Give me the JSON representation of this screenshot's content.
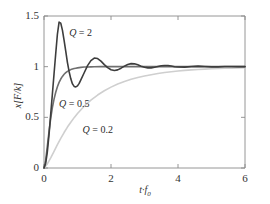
{
  "chart_data": {
    "type": "line",
    "title": "",
    "subtitle": "",
    "xlabel": "t·f0",
    "xlabel_parts": {
      "var": "t",
      "dot": "·",
      "f": "f",
      "sub": "0"
    },
    "ylabel": "x[F/k]",
    "ylabel_parts": {
      "x": "x",
      "open": "[",
      "F": "F",
      "slash": "/",
      "k": "k",
      "close": "]"
    },
    "xlim": [
      0,
      6
    ],
    "ylim": [
      0,
      1.5
    ],
    "xticks": [
      0,
      2,
      4,
      6
    ],
    "xtick_labels": [
      "0",
      "2",
      "4",
      "6"
    ],
    "yticks": [
      0,
      0.5,
      1,
      1.5
    ],
    "ytick_labels": [
      "0",
      "0.5",
      "1",
      "1.5"
    ],
    "grid": false,
    "legend_position": "inline-annotations",
    "axis_color": "#8a8a8a",
    "background": "#ffffff",
    "series": [
      {
        "name": "Q = 2",
        "label": "Q = 2",
        "q": 2,
        "color": "#3d3d3d",
        "width": 1.6,
        "annotation_x": 0.75,
        "annotation_y": 1.32,
        "description": "Underdamped step response, overshoot to 1.45 at t*f0=0.45, ringing decays by t*f0=4",
        "points": [
          [
            0.0,
            0.0
          ],
          [
            0.05,
            0.045
          ],
          [
            0.1,
            0.16
          ],
          [
            0.15,
            0.33
          ],
          [
            0.2,
            0.53
          ],
          [
            0.25,
            0.73
          ],
          [
            0.3,
            0.93
          ],
          [
            0.35,
            1.13
          ],
          [
            0.4,
            1.32
          ],
          [
            0.45,
            1.44
          ],
          [
            0.5,
            1.43
          ],
          [
            0.55,
            1.36
          ],
          [
            0.6,
            1.26
          ],
          [
            0.65,
            1.15
          ],
          [
            0.7,
            1.04
          ],
          [
            0.75,
            0.95
          ],
          [
            0.8,
            0.88
          ],
          [
            0.85,
            0.83
          ],
          [
            0.9,
            0.805
          ],
          [
            0.95,
            0.8
          ],
          [
            1.0,
            0.81
          ],
          [
            1.05,
            0.835
          ],
          [
            1.1,
            0.87
          ],
          [
            1.2,
            0.94
          ],
          [
            1.3,
            1.01
          ],
          [
            1.4,
            1.06
          ],
          [
            1.5,
            1.085
          ],
          [
            1.6,
            1.08
          ],
          [
            1.7,
            1.055
          ],
          [
            1.8,
            1.02
          ],
          [
            1.9,
            0.99
          ],
          [
            2.0,
            0.97
          ],
          [
            2.1,
            0.962
          ],
          [
            2.2,
            0.968
          ],
          [
            2.3,
            0.985
          ],
          [
            2.4,
            1.005
          ],
          [
            2.5,
            1.022
          ],
          [
            2.6,
            1.03
          ],
          [
            2.7,
            1.028
          ],
          [
            2.8,
            1.018
          ],
          [
            2.9,
            1.005
          ],
          [
            3.0,
            0.994
          ],
          [
            3.1,
            0.988
          ],
          [
            3.2,
            0.988
          ],
          [
            3.3,
            0.994
          ],
          [
            3.4,
            1.002
          ],
          [
            3.5,
            1.009
          ],
          [
            3.6,
            1.012
          ],
          [
            3.7,
            1.011
          ],
          [
            3.8,
            1.006
          ],
          [
            3.9,
            1.0
          ],
          [
            4.0,
            0.996
          ],
          [
            4.2,
            0.995
          ],
          [
            4.4,
            1.002
          ],
          [
            4.6,
            1.005
          ],
          [
            4.8,
            1.002
          ],
          [
            5.0,
            0.998
          ],
          [
            5.2,
            0.998
          ],
          [
            5.4,
            1.001
          ],
          [
            5.6,
            1.002
          ],
          [
            5.8,
            1.0
          ],
          [
            6.0,
            1.0
          ]
        ]
      },
      {
        "name": "Q = 0.5",
        "label": "Q = 0.5",
        "q": 0.5,
        "color": "#6f6f6f",
        "width": 1.6,
        "annotation_x": 0.45,
        "annotation_y": 0.62,
        "description": "Critically damped, monotonic rise to 1 with no overshoot",
        "points": [
          [
            0.0,
            0.0
          ],
          [
            0.05,
            0.075
          ],
          [
            0.1,
            0.215
          ],
          [
            0.15,
            0.36
          ],
          [
            0.2,
            0.49
          ],
          [
            0.25,
            0.595
          ],
          [
            0.3,
            0.68
          ],
          [
            0.35,
            0.748
          ],
          [
            0.4,
            0.802
          ],
          [
            0.45,
            0.845
          ],
          [
            0.5,
            0.878
          ],
          [
            0.55,
            0.904
          ],
          [
            0.6,
            0.925
          ],
          [
            0.65,
            0.941
          ],
          [
            0.7,
            0.954
          ],
          [
            0.75,
            0.963
          ],
          [
            0.8,
            0.971
          ],
          [
            0.85,
            0.977
          ],
          [
            0.9,
            0.982
          ],
          [
            0.95,
            0.985
          ],
          [
            1.0,
            0.988
          ],
          [
            1.1,
            0.993
          ],
          [
            1.2,
            0.996
          ],
          [
            1.3,
            0.997
          ],
          [
            1.4,
            0.998
          ],
          [
            1.5,
            0.999
          ],
          [
            1.7,
            1.0
          ],
          [
            2.0,
            1.0
          ],
          [
            2.5,
            1.0
          ],
          [
            3.0,
            1.0
          ],
          [
            4.0,
            1.0
          ],
          [
            5.0,
            1.0
          ],
          [
            6.0,
            1.0
          ]
        ]
      },
      {
        "name": "Q = 0.2",
        "label": "Q = 0.2",
        "q": 0.2,
        "color": "#cfcfcf",
        "width": 1.6,
        "annotation_x": 1.15,
        "annotation_y": 0.37,
        "description": "Overdamped, slow exponential approach to 1, reaching ~0.99 near t*f0=6",
        "points": [
          [
            0.0,
            0.0
          ],
          [
            0.1,
            0.04
          ],
          [
            0.2,
            0.1
          ],
          [
            0.3,
            0.165
          ],
          [
            0.4,
            0.23
          ],
          [
            0.5,
            0.292
          ],
          [
            0.6,
            0.35
          ],
          [
            0.7,
            0.404
          ],
          [
            0.8,
            0.452
          ],
          [
            0.9,
            0.497
          ],
          [
            1.0,
            0.538
          ],
          [
            1.2,
            0.61
          ],
          [
            1.4,
            0.67
          ],
          [
            1.6,
            0.72
          ],
          [
            1.8,
            0.762
          ],
          [
            2.0,
            0.798
          ],
          [
            2.2,
            0.828
          ],
          [
            2.4,
            0.853
          ],
          [
            2.6,
            0.875
          ],
          [
            2.8,
            0.893
          ],
          [
            3.0,
            0.908
          ],
          [
            3.2,
            0.921
          ],
          [
            3.4,
            0.932
          ],
          [
            3.6,
            0.942
          ],
          [
            3.8,
            0.95
          ],
          [
            4.0,
            0.957
          ],
          [
            4.2,
            0.963
          ],
          [
            4.4,
            0.968
          ],
          [
            4.6,
            0.972
          ],
          [
            4.8,
            0.976
          ],
          [
            5.0,
            0.979
          ],
          [
            5.2,
            0.982
          ],
          [
            5.4,
            0.984
          ],
          [
            5.6,
            0.986
          ],
          [
            5.8,
            0.988
          ],
          [
            6.0,
            0.99
          ]
        ]
      }
    ]
  },
  "plot_geometry": {
    "left": 44,
    "right": 245,
    "top": 16,
    "bottom": 168
  }
}
